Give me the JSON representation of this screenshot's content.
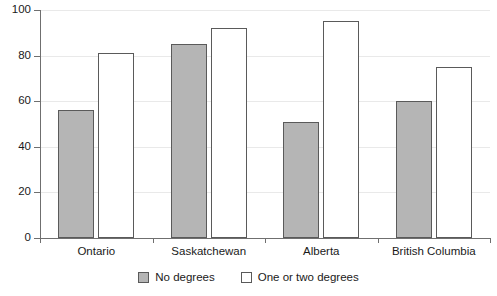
{
  "chart_data": {
    "type": "bar",
    "title": "",
    "xlabel": "",
    "ylabel": "",
    "ylim": [
      0,
      100
    ],
    "yticks": [
      0,
      20,
      40,
      60,
      80,
      100
    ],
    "grid": true,
    "legend_position": "bottom-center",
    "categories": [
      "Ontario",
      "Saskatchewan",
      "Alberta",
      "British Columbia"
    ],
    "series": [
      {
        "name": "No degrees",
        "color": "#b5b5b5",
        "values": [
          56,
          85,
          51,
          60
        ]
      },
      {
        "name": "One or two degrees",
        "color": "#ffffff",
        "values": [
          81,
          92,
          95,
          75
        ]
      }
    ]
  },
  "axis": {
    "tick_labels": [
      "0",
      "20",
      "40",
      "60",
      "80",
      "100"
    ]
  },
  "legend": {
    "items": [
      {
        "label": "No degrees",
        "swatch": "gray"
      },
      {
        "label": "One or two degrees",
        "swatch": "white"
      }
    ]
  },
  "colors": {
    "bar_fill_gray": "#b5b5b5",
    "bar_fill_white": "#ffffff",
    "bar_border": "#5a5a5a",
    "axis": "#6f6f6f",
    "gridline": "#e9e9e9",
    "text": "#1a1a1a"
  }
}
